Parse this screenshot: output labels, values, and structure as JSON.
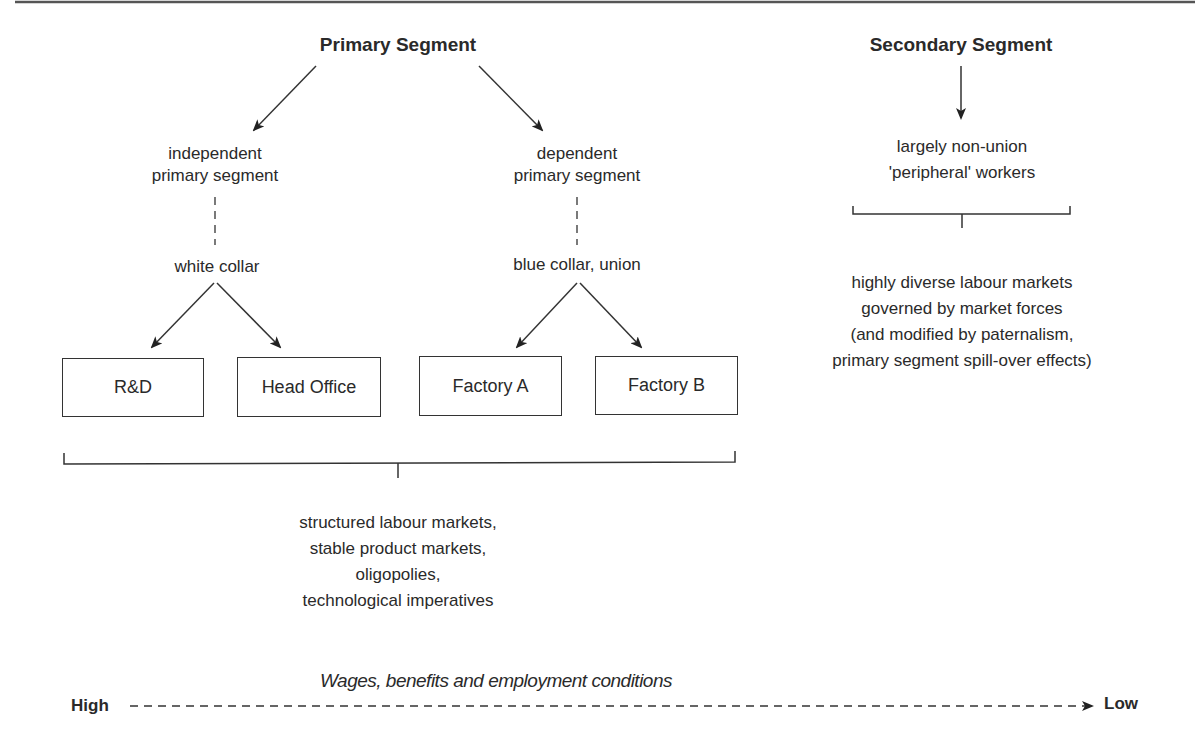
{
  "primary": {
    "title": "Primary Segment",
    "independent": {
      "line1": "independent",
      "line2": "primary segment",
      "sub": "white collar"
    },
    "dependent": {
      "line1": "dependent",
      "line2": "primary segment",
      "sub": "blue collar, union"
    },
    "boxes": [
      "R&D",
      "Head Office",
      "Factory A",
      "Factory B"
    ],
    "description": [
      "structured labour markets,",
      "stable product markets,",
      "oligopolies,",
      "technological imperatives"
    ]
  },
  "secondary": {
    "title": "Secondary Segment",
    "workers": {
      "line1": "largely non-union",
      "line2": "'peripheral' workers"
    },
    "description": [
      "highly diverse labour markets",
      "governed by market forces",
      "(and modified by paternalism,",
      "primary segment spill-over effects)"
    ]
  },
  "axis": {
    "title": "Wages, benefits and employment conditions",
    "left_label": "High",
    "right_label": "Low"
  },
  "colors": {
    "line": "#333333",
    "text": "#2a2a2a"
  }
}
